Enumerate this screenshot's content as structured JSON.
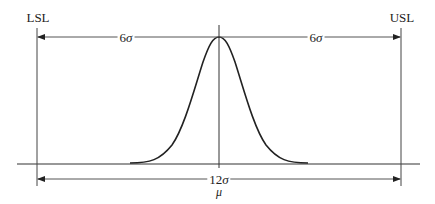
{
  "diagram": {
    "labels": {
      "lsl": "LSL",
      "usl": "USL",
      "left_span_num": "6",
      "left_span_sym": "σ",
      "right_span_num": "6",
      "right_span_sym": "σ",
      "total_span_num": "12",
      "total_span_sym": "σ",
      "mean": "μ"
    },
    "elements": {
      "lsl_line": {
        "x": 37,
        "y1": 28,
        "y2": 186
      },
      "usl_line": {
        "x": 401,
        "y1": 28,
        "y2": 186
      },
      "mean_line": {
        "x": 219,
        "y1": 25,
        "y2": 168
      },
      "baseline": {
        "y": 164,
        "x1": 17,
        "x2": 420
      },
      "top_arrow_y": 37,
      "bottom_arrow_y": 179,
      "curve": {
        "peak_x": 219,
        "peak_y": 37,
        "base_y": 163,
        "left_x": 130,
        "right_x": 308
      }
    },
    "colors": {
      "line": "#222222",
      "guide": "#555555",
      "background": "#ffffff"
    }
  }
}
